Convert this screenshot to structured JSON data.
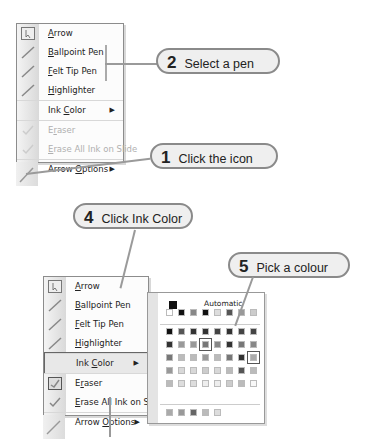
{
  "menu_top": {
    "items": [
      {
        "label": "Arrow",
        "accel": "A",
        "rest": "rrow",
        "icon": "arrow-cursor-icon",
        "disabled": false
      },
      {
        "label": "Ballpoint Pen",
        "accel": "B",
        "rest": "allpoint Pen",
        "icon": "ballpoint-pen-icon",
        "disabled": false
      },
      {
        "label": "Felt Tip Pen",
        "accel": "F",
        "rest": "elt Tip Pen",
        "icon": "felt-tip-pen-icon",
        "disabled": false
      },
      {
        "label": "Highlighter",
        "accel": "H",
        "rest": "ighlighter",
        "icon": "highlighter-icon",
        "disabled": false
      },
      {
        "label": "Ink Color",
        "pre": "Ink ",
        "accel": "C",
        "rest": "olor",
        "submenu": true,
        "disabled": false
      },
      {
        "label": "Eraser",
        "pre": "E",
        "accel": "r",
        "rest": "aser",
        "icon": "eraser-icon",
        "disabled": true
      },
      {
        "label": "Erase All Ink on Slide",
        "accel": "E",
        "rest": "rase All Ink on Slide",
        "icon": "erase-all-icon",
        "disabled": true
      },
      {
        "label": "Arrow Options",
        "pre": "Arrow ",
        "accel": "O",
        "rest": "ptions",
        "submenu": true,
        "disabled": false
      }
    ]
  },
  "menu_bottom": {
    "items": [
      {
        "label": "Arrow"
      },
      {
        "label": "Ballpoint Pen"
      },
      {
        "label": "Felt Tip Pen"
      },
      {
        "label": "Highlighter"
      },
      {
        "label": "Ink Color",
        "highlighted": true
      },
      {
        "label": "Eraser",
        "checked": true
      },
      {
        "label": "Erase All Ink on Slide"
      },
      {
        "label": "Arrow Options"
      }
    ]
  },
  "callouts": [
    {
      "num": "2",
      "text": "Select a pen"
    },
    {
      "num": "1",
      "text": "Click the icon"
    },
    {
      "num": "4",
      "text": "Click Ink Color"
    },
    {
      "num": "5",
      "text": "Pick a colour"
    }
  ],
  "palette": {
    "automatic_label": "Automatic",
    "automatic_color": "#111111",
    "rows": [
      [
        "#ffffff",
        "#111111",
        "#888888",
        "#111111",
        "#dddddd",
        "#555555",
        "#999999",
        "#cccccc"
      ],
      [
        "#111111",
        "#555555",
        "#333333",
        "#333333",
        "#444444",
        "#333333",
        "#444444",
        "#444444"
      ],
      [
        "#333333",
        "#999999",
        "#999999",
        "#777777",
        "#888888",
        "#333333",
        "#777777",
        "#888888"
      ],
      [
        "#777777",
        "#bbbbbb",
        "#bbbbbb",
        "#999999",
        "#bbbbbb",
        "#777777",
        "#333333",
        "#aaaaaa"
      ],
      [
        "#999999",
        "#d8d8d8",
        "#d8d8d8",
        "#cccccc",
        "#d8d8d8",
        "#bbbbbb",
        "#555555",
        "#bbbbbb"
      ],
      [
        "#bbbbbb",
        "#dddddd",
        "#dddddd",
        "#eeeeee",
        "#eeeeee",
        "#cccccc",
        "#bbbbbb",
        "#f8f8f8"
      ]
    ],
    "recent": [
      "#aaaaaa",
      "#999999",
      "#666666",
      "#bbbbbb",
      "#dddddd"
    ]
  }
}
